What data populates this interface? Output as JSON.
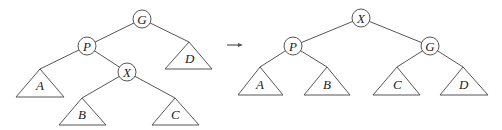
{
  "diagram": {
    "type": "tree-rotation",
    "before": {
      "nodes": [
        {
          "id": "G",
          "label": "G",
          "x": 142,
          "y": 19
        },
        {
          "id": "P",
          "label": "P",
          "x": 87,
          "y": 46
        },
        {
          "id": "X",
          "label": "X",
          "x": 127,
          "y": 72
        }
      ],
      "subtrees": [
        {
          "id": "A",
          "label": "A",
          "apex": [
            40,
            69
          ],
          "base_y": 97,
          "base_x": [
            16,
            64
          ]
        },
        {
          "id": "D",
          "label": "D",
          "apex": [
            189,
            42
          ],
          "base_y": 69,
          "base_x": [
            165,
            212
          ]
        },
        {
          "id": "B",
          "label": "B",
          "apex": [
            82,
            98
          ],
          "base_y": 125,
          "base_x": [
            59,
            106
          ]
        },
        {
          "id": "C",
          "label": "C",
          "apex": [
            175,
            98
          ],
          "base_y": 125,
          "base_x": [
            152,
            199
          ]
        }
      ],
      "edges": [
        [
          "G",
          "P"
        ],
        [
          "G",
          "D"
        ],
        [
          "P",
          "A"
        ],
        [
          "P",
          "X"
        ],
        [
          "X",
          "B"
        ],
        [
          "X",
          "C"
        ]
      ]
    },
    "arrow": {
      "symbol": "→"
    },
    "after": {
      "nodes": [
        {
          "id": "X",
          "label": "X",
          "x": 361,
          "y": 18
        },
        {
          "id": "P",
          "label": "P",
          "x": 293,
          "y": 46
        },
        {
          "id": "G",
          "label": "G",
          "x": 430,
          "y": 46
        }
      ],
      "subtrees": [
        {
          "id": "A",
          "label": "A",
          "apex": [
            260,
            67
          ],
          "base_y": 95,
          "base_x": [
            238,
            283
          ]
        },
        {
          "id": "B",
          "label": "B",
          "apex": [
            327,
            67
          ],
          "base_y": 95,
          "base_x": [
            304,
            350
          ]
        },
        {
          "id": "C",
          "label": "C",
          "apex": [
            397,
            67
          ],
          "base_y": 95,
          "base_x": [
            373,
            420
          ]
        },
        {
          "id": "D",
          "label": "D",
          "apex": [
            463,
            67
          ],
          "base_y": 95,
          "base_x": [
            440,
            488
          ]
        }
      ],
      "edges": [
        [
          "X",
          "P"
        ],
        [
          "X",
          "G"
        ],
        [
          "P",
          "A"
        ],
        [
          "P",
          "B"
        ],
        [
          "G",
          "C"
        ],
        [
          "G",
          "D"
        ]
      ]
    }
  }
}
